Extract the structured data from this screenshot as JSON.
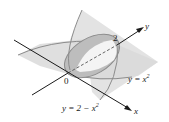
{
  "diagram": {
    "type": "3d-surface-intersection",
    "labels": {
      "origin": "0",
      "y_axis": "y",
      "x_axis": "x",
      "tick_y": "2",
      "curve1": "y = x",
      "curve1_exp": "2",
      "curve2": "y = 2 − x",
      "curve2_exp": "2"
    },
    "colors": {
      "plane_light": "#e6e6e6",
      "plane_mid": "#d2d2d2",
      "region_dark": "#b9b9b9",
      "region_highlight": "#f2f2f2",
      "curve": "#8c8c8c",
      "axis": "#1a1a1a"
    }
  }
}
